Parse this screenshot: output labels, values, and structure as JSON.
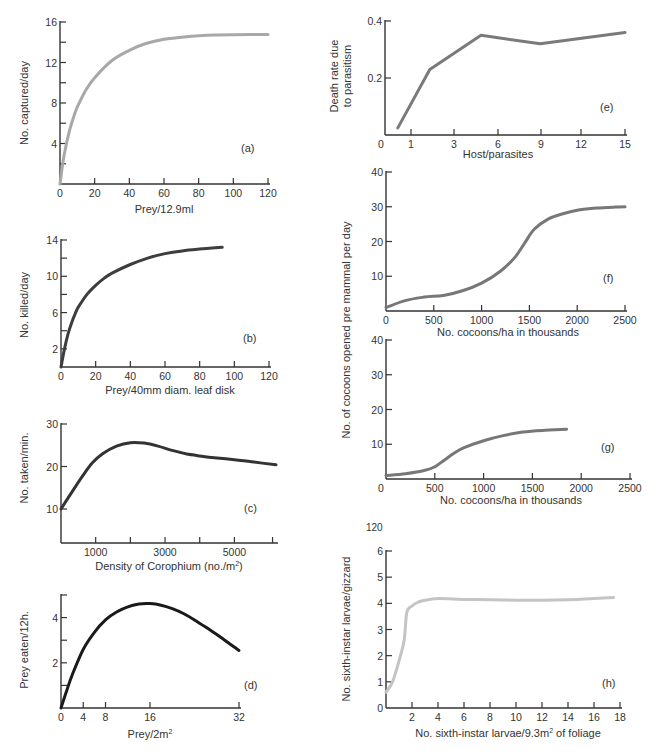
{
  "figure": {
    "stray_label_h_top": "120"
  },
  "chart_data": [
    {
      "id": "a",
      "panel_label": "(a)",
      "type": "line",
      "title": "",
      "xlabel": "Prey/12.9ml",
      "ylabel": "No. captured/day",
      "xlim": [
        0,
        120
      ],
      "ylim": [
        0,
        16
      ],
      "x_ticks": [
        0,
        20,
        40,
        60,
        80,
        100,
        120
      ],
      "x_tick_labels": [
        "0",
        "20",
        "40",
        "60",
        "80",
        "100",
        "120"
      ],
      "y_ticks": [
        2,
        4,
        6,
        8,
        10,
        12,
        14,
        16
      ],
      "y_tick_labels": {
        "4": "4",
        "8": "8",
        "12": "12",
        "16": "16"
      },
      "line_color": "#a8a8a8",
      "line_width": 3,
      "x": [
        0,
        1,
        2,
        4,
        6,
        8,
        10,
        15,
        20,
        30,
        40,
        50,
        60,
        70,
        80,
        90,
        100,
        110,
        120
      ],
      "y": [
        0,
        1.3,
        2.5,
        4.2,
        5.6,
        6.7,
        7.6,
        9.3,
        10.5,
        12.2,
        13.2,
        13.9,
        14.3,
        14.5,
        14.65,
        14.72,
        14.75,
        14.76,
        14.76
      ],
      "box": {
        "x0": 60,
        "x1": 268,
        "y0": 184,
        "y1": 22
      }
    },
    {
      "id": "b",
      "panel_label": "(b)",
      "type": "line",
      "xlabel": "Prey/40mm diam. leaf disk",
      "ylabel": "No. killed/day",
      "xlim": [
        0,
        120
      ],
      "ylim": [
        0,
        14
      ],
      "x_ticks": [
        0,
        20,
        40,
        60,
        80,
        100,
        120
      ],
      "x_tick_labels": [
        "0",
        "20",
        "40",
        "60",
        "80",
        "100",
        "120"
      ],
      "y_ticks": [
        2,
        4,
        6,
        8,
        10,
        12,
        14
      ],
      "y_tick_labels": {
        "2": "2",
        "6": "6",
        "10": "10",
        "14": "14"
      },
      "line_color": "#3d3d3d",
      "line_width": 3,
      "x": [
        0,
        2,
        4,
        6,
        8,
        10,
        15,
        20,
        25,
        30,
        40,
        50,
        60,
        70,
        80,
        93
      ],
      "y": [
        0,
        2.0,
        3.6,
        4.8,
        5.8,
        6.6,
        8.0,
        9.0,
        9.8,
        10.4,
        11.3,
        12.0,
        12.5,
        12.8,
        13.0,
        13.2
      ],
      "box": {
        "x0": 61,
        "x1": 269,
        "y0": 367,
        "y1": 240
      }
    },
    {
      "id": "c",
      "panel_label": "(c)",
      "type": "line",
      "xlabel": "Density of Corophium (no./m²)",
      "ylabel": "No. taken/min.",
      "xlim": [
        0,
        6200
      ],
      "ylim": [
        2,
        30
      ],
      "x_ticks": [
        1000,
        2000,
        3000,
        4000,
        5000,
        6100
      ],
      "x_tick_labels": {
        "1000": "1000",
        "3000": "3000",
        "5000": "5000"
      },
      "y_ticks": [
        10,
        20,
        30
      ],
      "y_tick_labels": {
        "10": "10",
        "20": "20",
        "30": "30"
      },
      "line_color": "#333333",
      "line_width": 3,
      "x": [
        0,
        300,
        600,
        900,
        1200,
        1600,
        2000,
        2400,
        2800,
        3200,
        3600,
        4000,
        4500,
        5000,
        5500,
        6200
      ],
      "y": [
        10,
        13.8,
        17.5,
        20.8,
        23.0,
        24.8,
        25.6,
        25.5,
        24.8,
        23.8,
        23.0,
        22.5,
        22.0,
        21.6,
        21.1,
        20.4
      ],
      "box": {
        "x0": 61,
        "x1": 276,
        "y0": 543,
        "y1": 424
      }
    },
    {
      "id": "d",
      "panel_label": "(d)",
      "type": "line",
      "xlabel": "Prey/2m²",
      "ylabel": "Prey eaten/12h.",
      "xlim": [
        0,
        32
      ],
      "ylim": [
        0,
        5
      ],
      "x_ticks": [
        0,
        4,
        8,
        16,
        32
      ],
      "x_tick_labels": [
        "0",
        "4",
        "8",
        "16",
        "32"
      ],
      "y_ticks": [
        1,
        2,
        3,
        4,
        5
      ],
      "y_tick_labels": {
        "2": "2",
        "4": "4"
      },
      "line_color": "#1a1a1a",
      "line_width": 3,
      "x": [
        0,
        1,
        2,
        4,
        6,
        8,
        10,
        12,
        14,
        16,
        18,
        20,
        22,
        24,
        26,
        28,
        30,
        32
      ],
      "y": [
        0,
        0.75,
        1.45,
        2.6,
        3.35,
        3.9,
        4.25,
        4.48,
        4.6,
        4.62,
        4.55,
        4.4,
        4.18,
        3.9,
        3.58,
        3.25,
        2.9,
        2.55
      ],
      "box": {
        "x0": 61,
        "x1": 239,
        "y0": 708,
        "y1": 595
      }
    },
    {
      "id": "e",
      "panel_label": "(e)",
      "type": "line",
      "xlabel": "Host/parasites",
      "ylabel": "Death rate due to parasitism",
      "xlim": [
        0,
        15
      ],
      "ylim": [
        0,
        0.4
      ],
      "x_ticks": [
        1,
        3,
        6,
        9,
        12,
        15
      ],
      "x_tick_labels": [
        "1",
        "3",
        "6",
        "9",
        "12",
        "15"
      ],
      "x_origin_label": "0",
      "y_ticks": [
        0.2,
        0.4
      ],
      "y_tick_labels": {
        "0.2": "0.2",
        "0.4": "0.4"
      },
      "line_color": "#7a7a7a",
      "line_width": 3,
      "x": [
        0.8,
        2.8,
        6,
        9.7,
        15
      ],
      "y": [
        0.025,
        0.23,
        0.35,
        0.32,
        0.36
      ],
      "box": {
        "x0": 385,
        "x1": 625,
        "y0": 135,
        "y1": 21
      },
      "x_positions": {
        "0": 381,
        "1": 411,
        "3": 454,
        "6": 498,
        "9": 541,
        "12": 581,
        "15": 625
      }
    },
    {
      "id": "f",
      "panel_label": "(f)",
      "type": "line",
      "xlabel": "No. cocoons/ha in thousands",
      "ylabel": "No. of cocoons opened pre mammal per day",
      "xlim": [
        0,
        2500
      ],
      "ylim": [
        0,
        40
      ],
      "x_ticks": [
        0,
        500,
        1000,
        1500,
        2000,
        2500
      ],
      "x_tick_labels": [
        "0",
        "500",
        "1000",
        "1500",
        "2000",
        "2500"
      ],
      "y_ticks": [
        10,
        20,
        30,
        40
      ],
      "y_tick_labels": {
        "10": "10",
        "20": "20",
        "30": "30",
        "40": "40"
      },
      "line_color": "#777777",
      "line_width": 3,
      "x": [
        0,
        200,
        400,
        600,
        800,
        1000,
        1200,
        1350,
        1450,
        1550,
        1700,
        1850,
        2000,
        2200,
        2400,
        2500
      ],
      "y": [
        1,
        3,
        4,
        4.5,
        5.8,
        8,
        11.5,
        15.5,
        19.5,
        23.5,
        26.5,
        28,
        29,
        29.6,
        29.9,
        30
      ],
      "box": {
        "x0": 386,
        "x1": 625,
        "y0": 311,
        "y1": 172
      }
    },
    {
      "id": "g",
      "panel_label": "(g)",
      "type": "line",
      "xlabel": "No. cocoons/ha in thousands",
      "ylabel": "No. of cocoons opened pre mammal per day",
      "xlim": [
        0,
        2500
      ],
      "ylim": [
        0,
        40
      ],
      "x_ticks": [
        500,
        1000,
        1500,
        2000,
        2500
      ],
      "x_tick_labels": [
        "500",
        "1000",
        "1500",
        "2000",
        "2500"
      ],
      "x_origin_label": "0",
      "y_ticks": [
        10,
        20,
        30,
        40
      ],
      "y_tick_labels": {
        "10": "10",
        "20": "20",
        "30": "30",
        "40": "40"
      },
      "line_color": "#777777",
      "line_width": 3,
      "x": [
        0,
        200,
        400,
        500,
        600,
        700,
        800,
        1000,
        1200,
        1400,
        1600,
        1850
      ],
      "y": [
        1,
        1.5,
        2.5,
        3.5,
        5.5,
        7.5,
        9,
        11,
        12.5,
        13.5,
        14,
        14.3
      ],
      "box": {
        "x0": 386,
        "x1": 630,
        "y0": 479,
        "y1": 340
      }
    },
    {
      "id": "h",
      "panel_label": "(h)",
      "type": "line",
      "xlabel": "No. sixth-instar larvae/9.3m² of foliage",
      "ylabel": "No. sixth-instar larvae/gizzard",
      "xlim": [
        0,
        18
      ],
      "ylim": [
        0,
        6
      ],
      "x_ticks": [
        2,
        4,
        6,
        8,
        10,
        12,
        14,
        16,
        18
      ],
      "x_tick_labels": [
        "2",
        "4",
        "6",
        "8",
        "10",
        "12",
        "14",
        "16",
        "18"
      ],
      "y_ticks": [
        0,
        1,
        2,
        3,
        4,
        5,
        6
      ],
      "y_tick_labels": {
        "0": "0",
        "1": "1",
        "2": "2",
        "3": "3",
        "4": "4",
        "5": "5",
        "6": "6"
      },
      "line_color": "#c4c4c4",
      "line_width": 3,
      "x": [
        0,
        0.5,
        1.0,
        1.4,
        1.6,
        2.0,
        2.5,
        3.0,
        4.0,
        6.0,
        8.0,
        10.0,
        12.0,
        14.0,
        16.0,
        17.5
      ],
      "y": [
        0.6,
        1.0,
        1.8,
        2.6,
        3.65,
        3.9,
        4.05,
        4.12,
        4.18,
        4.15,
        4.14,
        4.12,
        4.12,
        4.14,
        4.18,
        4.22
      ],
      "box": {
        "x0": 386,
        "x1": 620,
        "y0": 708,
        "y1": 551
      }
    }
  ]
}
